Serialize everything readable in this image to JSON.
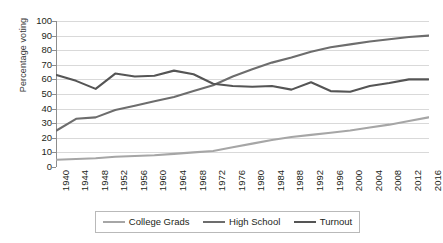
{
  "chart_data": {
    "type": "line",
    "title": "",
    "xlabel": "",
    "ylabel": "Percentage voting",
    "ylim": [
      0,
      100
    ],
    "ytick_step": 10,
    "grid": true,
    "legend_position": "bottom",
    "categories": [
      "1940",
      "1944",
      "1948",
      "1952",
      "1956",
      "1960",
      "1964",
      "1968",
      "1972",
      "1976",
      "1980",
      "1984",
      "1988",
      "1992",
      "1996",
      "2000",
      "2004",
      "2008",
      "2012",
      "2016"
    ],
    "yticks": [
      "0",
      "10",
      "20",
      "30",
      "40",
      "50",
      "60",
      "70",
      "80",
      "90",
      "100"
    ],
    "series": [
      {
        "name": "College Grads",
        "color": "#a6a6a6",
        "width": 2.1,
        "values": [
          5,
          5.5,
          6,
          7,
          7.5,
          8,
          9,
          10,
          11,
          13.5,
          16,
          18.5,
          20.5,
          22,
          23.5,
          25,
          27,
          29,
          31.5,
          34
        ]
      },
      {
        "name": "High School",
        "color": "#6d6d6d",
        "width": 2.1,
        "values": [
          25,
          33,
          34,
          39,
          42,
          45,
          48,
          52,
          56,
          62,
          67,
          71.5,
          75,
          79,
          82,
          84,
          86,
          87.5,
          89,
          90
        ]
      },
      {
        "name": "Turnout",
        "color": "#555555",
        "width": 2.1,
        "values": [
          63,
          59,
          53.5,
          64,
          62,
          62.5,
          66,
          63.5,
          57,
          55.5,
          55,
          55.5,
          53,
          58,
          52,
          51.5,
          55.5,
          57.5,
          60,
          60
        ]
      }
    ]
  }
}
